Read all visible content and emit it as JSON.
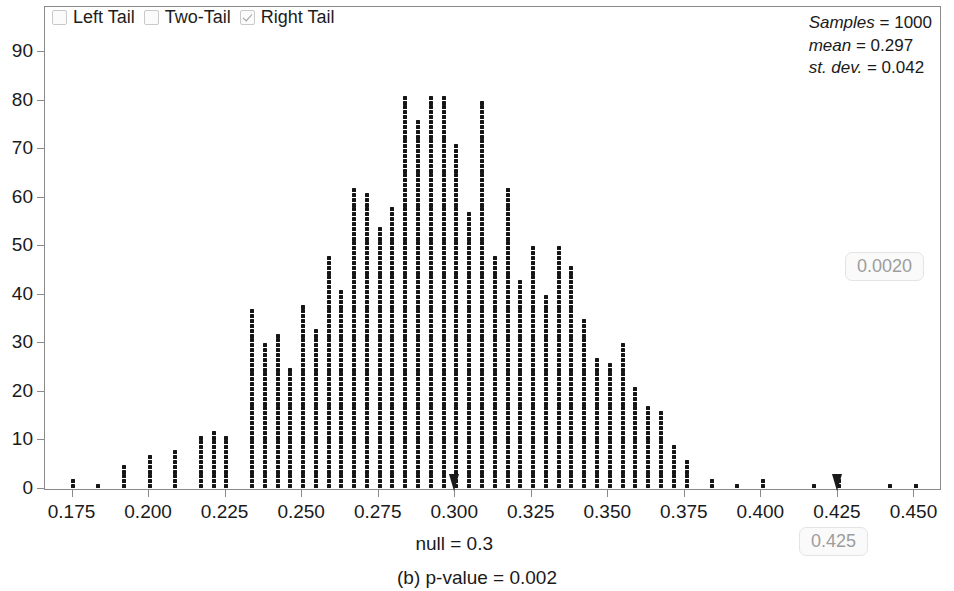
{
  "legend": {
    "items": [
      {
        "label": "Left Tail",
        "checked": false,
        "name": "left-tail"
      },
      {
        "label": "Two-Tail",
        "checked": false,
        "name": "two-tail"
      },
      {
        "label": "Right Tail",
        "checked": true,
        "name": "right-tail"
      }
    ]
  },
  "stats": {
    "samples_key": "Samples",
    "samples_eq": " = ",
    "samples_value": "1000",
    "mean_key": "mean",
    "mean_eq": " = ",
    "mean_value": "0.297",
    "sd_key": "st. dev.",
    "sd_eq": " = ",
    "sd_value": "0.042"
  },
  "badges": {
    "pvalue": "0.0020",
    "cutoff": "0.425"
  },
  "labels": {
    "null_label": "null = 0.3",
    "caption": "(b) p-value = 0.002"
  },
  "markers": {
    "null_x": 0.3,
    "cutoff_x": 0.425
  },
  "colors": {
    "dot": "#151515",
    "axis": "#8a8a8a",
    "badge_text": "#9d9d9d",
    "badge_bg": "#fafafa",
    "badge_border": "#e4e4e4",
    "text": "#1a1a1a"
  },
  "chart_data": {
    "type": "bar",
    "subtype": "dotplot",
    "title": "",
    "xlabel": "null = 0.3",
    "ylabel": "",
    "xlim": [
      0.166,
      0.459
    ],
    "ylim": [
      0,
      95
    ],
    "grid": false,
    "legend_position": "top-left",
    "yticks": [
      0,
      10,
      20,
      30,
      40,
      50,
      60,
      70,
      80,
      90
    ],
    "xticks": [
      0.175,
      0.2,
      0.225,
      0.25,
      0.275,
      0.3,
      0.325,
      0.35,
      0.375,
      0.4,
      0.425,
      0.45
    ],
    "xtick_labels": [
      "0.175",
      "0.200",
      "0.225",
      "0.250",
      "0.275",
      "0.300",
      "0.325",
      "0.350",
      "0.375",
      "0.400",
      "0.425",
      "0.450"
    ],
    "ytick_labels": [
      "0",
      "10",
      "20",
      "30",
      "40",
      "50",
      "60",
      "70",
      "80",
      "90"
    ],
    "bin_width": 0.0042,
    "x": [
      0.1755,
      0.1838,
      0.1922,
      0.2005,
      0.2089,
      0.2172,
      0.2214,
      0.2256,
      0.2339,
      0.2381,
      0.2423,
      0.2464,
      0.2506,
      0.2548,
      0.259,
      0.2631,
      0.2673,
      0.2715,
      0.2757,
      0.2798,
      0.284,
      0.2882,
      0.2924,
      0.2965,
      0.3007,
      0.3049,
      0.3091,
      0.3132,
      0.3174,
      0.3216,
      0.3258,
      0.3299,
      0.3341,
      0.3383,
      0.3425,
      0.3466,
      0.3508,
      0.355,
      0.3592,
      0.3633,
      0.3675,
      0.3717,
      0.3759,
      0.3842,
      0.3925,
      0.4008,
      0.4175,
      0.4258,
      0.4425,
      0.4508
    ],
    "values": [
      2,
      1,
      5,
      7,
      8,
      11,
      12,
      11,
      37,
      30,
      32,
      25,
      38,
      33,
      48,
      41,
      62,
      61,
      54,
      58,
      81,
      76,
      81,
      81,
      71,
      57,
      80,
      48,
      62,
      43,
      50,
      40,
      50,
      46,
      35,
      27,
      26,
      30,
      21,
      17,
      16,
      9,
      6,
      2,
      1,
      2,
      1,
      2,
      1,
      1
    ],
    "annotations": [
      {
        "text": "Samples = 1000",
        "position": "top-right"
      },
      {
        "text": "mean = 0.297",
        "position": "top-right"
      },
      {
        "text": "st. dev. = 0.042",
        "position": "top-right"
      },
      {
        "text": "0.0020",
        "position": "right"
      },
      {
        "text": "0.425",
        "position": "bottom-right"
      },
      {
        "text": "(b) p-value = 0.002",
        "position": "bottom-center"
      }
    ]
  }
}
